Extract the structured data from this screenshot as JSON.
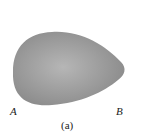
{
  "figure": {
    "caption": "(a)",
    "labels": {
      "left": "A",
      "right": "B"
    },
    "shape": {
      "kind": "egg-shaped blob",
      "fill_center": "#b4b4b4",
      "fill_edge": "#8c8c8c"
    }
  }
}
